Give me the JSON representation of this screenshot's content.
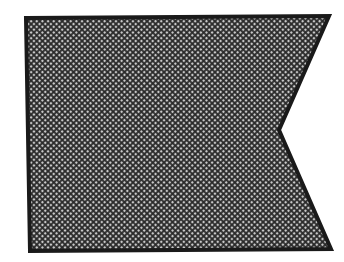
{
  "figure": {
    "shape": "swallowtail-pennant",
    "outline_color": "#1a1a1a",
    "fill_dark": "#2e2e2e",
    "fill_light": "#cfcfcf",
    "background": "#ffffff",
    "vertices": {
      "top_left": [
        26,
        18
      ],
      "top_right": [
        329,
        16
      ],
      "notch_apex": [
        279,
        130
      ],
      "bottom_right": [
        331,
        249
      ],
      "bottom_left": [
        30,
        251
      ]
    }
  }
}
